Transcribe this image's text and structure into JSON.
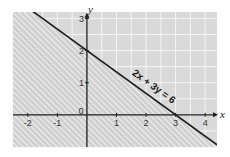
{
  "chart_data": {
    "type": "line",
    "title": "",
    "xlabel": "x",
    "ylabel": "y",
    "xlim": [
      -2.5,
      4.4
    ],
    "ylim": [
      -1,
      3.2
    ],
    "grid": true,
    "grid_step": 0.5,
    "x_ticks": [
      -2,
      -1,
      0,
      1,
      2,
      3,
      4
    ],
    "x_tick_labels": [
      "-2",
      "-1",
      "0",
      "1",
      "2",
      "3",
      "4"
    ],
    "y_ticks": [
      1,
      2,
      3
    ],
    "y_tick_labels": [
      "1",
      "2",
      "3"
    ],
    "origin_label": "0",
    "series": [
      {
        "name": "2x + 3y = 6",
        "equation": "2x + 3y = 6",
        "x": [
          -2.5,
          4.4
        ],
        "y": [
          3.6667,
          -0.9333
        ],
        "x_intercept": 3,
        "y_intercept": 2
      }
    ],
    "shaded_region": {
      "inequality": "2x + 3y < 6",
      "side": "below-left",
      "pattern": "diagonal-hatch"
    },
    "annotations": [
      {
        "text": "2x + 3y = 6",
        "at_x": 2.2,
        "at_y": 0.8
      }
    ],
    "colors": {
      "background": "#d9d9d9",
      "grid": "#f4f4f4",
      "hatch": "#ffffff",
      "line": "#1e1e1e",
      "axis": "#1e1e1e"
    }
  }
}
